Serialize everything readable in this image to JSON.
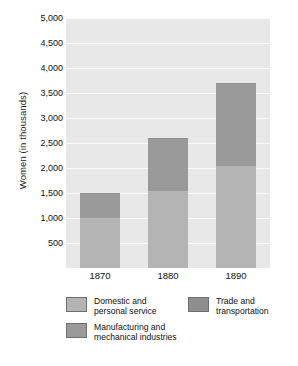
{
  "chart_data": {
    "type": "bar",
    "subtype": "stacked-bar",
    "title": "",
    "xlabel": "",
    "ylabel": "Women (in thousands)",
    "categories": [
      "1870",
      "1880",
      "1890"
    ],
    "ylim": [
      0,
      5000
    ],
    "ytick_values": [
      500,
      1000,
      1500,
      2000,
      2500,
      3000,
      3500,
      4000,
      4500,
      5000
    ],
    "ytick_labels": [
      "500",
      "1,000",
      "1,500",
      "2,000",
      "2,500",
      "3,000",
      "3,500",
      "4,000",
      "4,500",
      "5,000"
    ],
    "grid": true,
    "legend_position": "bottom",
    "series": [
      {
        "name": "Domestic and\npersonal service",
        "color": "#b4b4b4",
        "values": [
          1000,
          1550,
          2050
        ]
      },
      {
        "name": "Manufacturing and\nmechanical industries",
        "color": "#9a9a9a",
        "values": [
          490,
          1040,
          1630
        ]
      },
      {
        "name": "Trade and\ntransportation",
        "color": "#8f8f8f",
        "values": [
          10,
          20,
          30
        ]
      }
    ],
    "totals": [
      1500,
      2610,
      3710
    ]
  },
  "axis": {
    "y_title": "Women (in thousands)"
  },
  "legend": {
    "items": [
      {
        "label": "Domestic and\npersonal service",
        "color": "#b4b4b4"
      },
      {
        "label": "Manufacturing and\nmechanical industries",
        "color": "#9a9a9a"
      },
      {
        "label": "Trade and\ntransportation",
        "color": "#8f8f8f"
      }
    ]
  },
  "colors": {
    "plot_background": "#e8e8e8",
    "gridline": "#fbfbfb",
    "page_background": "#ffffff",
    "text": "#111111"
  }
}
